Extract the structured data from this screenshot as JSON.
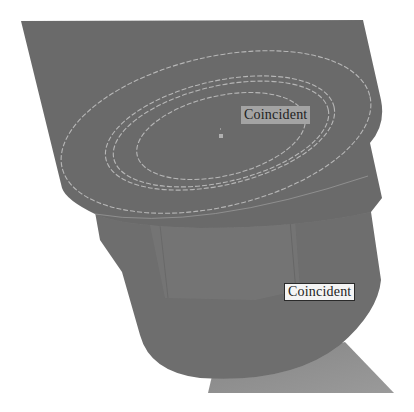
{
  "viewport": {
    "background": "#ffffff",
    "part_color_top": "#6b6b6b",
    "part_color_mid": "#707070",
    "part_color_band": "#787878",
    "part_color_base": "#8a8a8a",
    "edge_highlight": "#bdbdbd"
  },
  "model": {
    "name": "3D part view",
    "features": [
      {
        "type": "top-face",
        "ellipses": 4,
        "center_point": true
      },
      {
        "type": "cylindrical-body"
      },
      {
        "type": "base-wedge"
      }
    ]
  },
  "annotations": [
    {
      "id": "constraint-1",
      "text": "Coincident",
      "style": "plain"
    },
    {
      "id": "constraint-2",
      "text": "Coincident",
      "style": "boxed"
    }
  ]
}
